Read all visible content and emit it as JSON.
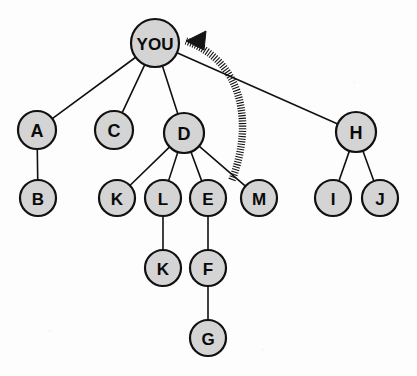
{
  "diagram": {
    "type": "tree",
    "background_color": "#fdfdfd",
    "node_fill_color": "#d4d4d4",
    "node_stroke_color": "#111111",
    "edge_color": "#111111",
    "arrow_color": "#141414",
    "root_id": "YOU",
    "nodes": [
      {
        "id": "YOU",
        "label": "YOU",
        "x": 155,
        "y": 43,
        "r": 24,
        "font_size": 17,
        "level": 0
      },
      {
        "id": "A",
        "label": "A",
        "x": 37,
        "y": 130,
        "r": 19,
        "font_size": 18,
        "level": 1
      },
      {
        "id": "C",
        "label": "C",
        "x": 114,
        "y": 130,
        "r": 19,
        "font_size": 18,
        "level": 1
      },
      {
        "id": "D",
        "label": "D",
        "x": 184,
        "y": 133,
        "r": 20,
        "font_size": 18,
        "level": 1
      },
      {
        "id": "H",
        "label": "H",
        "x": 356,
        "y": 132,
        "r": 20,
        "font_size": 18,
        "level": 1
      },
      {
        "id": "B",
        "label": "B",
        "x": 38,
        "y": 198,
        "r": 18,
        "font_size": 17,
        "level": 2
      },
      {
        "id": "K1",
        "label": "K",
        "x": 117,
        "y": 198,
        "r": 18,
        "font_size": 17,
        "level": 2
      },
      {
        "id": "L",
        "label": "L",
        "x": 163,
        "y": 198,
        "r": 18,
        "font_size": 17,
        "level": 2
      },
      {
        "id": "E",
        "label": "E",
        "x": 208,
        "y": 198,
        "r": 18,
        "font_size": 17,
        "level": 2
      },
      {
        "id": "M",
        "label": "M",
        "x": 259,
        "y": 198,
        "r": 18,
        "font_size": 17,
        "level": 2
      },
      {
        "id": "I",
        "label": "I",
        "x": 333,
        "y": 198,
        "r": 18,
        "font_size": 17,
        "level": 2
      },
      {
        "id": "J",
        "label": "J",
        "x": 380,
        "y": 198,
        "r": 18,
        "font_size": 17,
        "level": 2
      },
      {
        "id": "K2",
        "label": "K",
        "x": 163,
        "y": 268,
        "r": 18,
        "font_size": 17,
        "level": 3
      },
      {
        "id": "F",
        "label": "F",
        "x": 208,
        "y": 268,
        "r": 18,
        "font_size": 17,
        "level": 3
      },
      {
        "id": "G",
        "label": "G",
        "x": 208,
        "y": 338,
        "r": 18,
        "font_size": 17,
        "level": 4
      }
    ],
    "edges": [
      {
        "from": "YOU",
        "to": "A"
      },
      {
        "from": "YOU",
        "to": "C"
      },
      {
        "from": "YOU",
        "to": "D"
      },
      {
        "from": "YOU",
        "to": "H"
      },
      {
        "from": "A",
        "to": "B"
      },
      {
        "from": "D",
        "to": "K1"
      },
      {
        "from": "D",
        "to": "L"
      },
      {
        "from": "D",
        "to": "E"
      },
      {
        "from": "D",
        "to": "M"
      },
      {
        "from": "H",
        "to": "I"
      },
      {
        "from": "H",
        "to": "J"
      },
      {
        "from": "L",
        "to": "K2"
      },
      {
        "from": "E",
        "to": "F"
      },
      {
        "from": "F",
        "to": "G"
      }
    ],
    "relation_arrow": {
      "name": "curved-hatched-arrow",
      "style": "hatched-dashed-curve",
      "direction": "points-to-YOU",
      "start_x": 232,
      "start_y": 180,
      "end_x": 186,
      "end_y": 41,
      "control1_x": 253,
      "control1_y": 126,
      "control2_x": 245,
      "control2_y": 62,
      "head_points": "186,41 206,31 204,50"
    }
  }
}
